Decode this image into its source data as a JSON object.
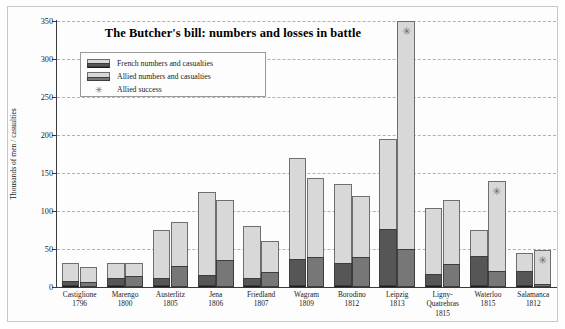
{
  "chart_data": {
    "type": "bar",
    "title": "The Butcher's bill:  numbers and losses in battle",
    "xlabel": "",
    "ylabel": "Thousands of men / casualties",
    "ylim": [
      0,
      350
    ],
    "yticks": [
      0,
      50,
      100,
      150,
      200,
      250,
      300,
      350
    ],
    "grid": true,
    "legend_position": "upper-left-inside",
    "categories": [
      "Castiglione 1796",
      "Marengo 1800",
      "Austerlitz 1805",
      "Jena 1806",
      "Friedland 1807",
      "Wagram 1809",
      "Borodino 1812",
      "Leipzig 1813",
      "Ligny-Quatrebras 1815",
      "Waterloo 1815",
      "Salamanca 1812"
    ],
    "battles": [
      {
        "name": "Castiglione",
        "year": "1796",
        "french_numbers": 31,
        "french_casualties": 6,
        "allied_numbers": 26,
        "allied_casualties": 6,
        "allied_success": false
      },
      {
        "name": "Marengo",
        "year": "1800",
        "french_numbers": 31,
        "french_casualties": 10,
        "allied_numbers": 31,
        "allied_casualties": 15,
        "allied_success": false
      },
      {
        "name": "Austerlitz",
        "year": "1805",
        "french_numbers": 75,
        "french_casualties": 10,
        "allied_numbers": 85,
        "allied_casualties": 27,
        "allied_success": false
      },
      {
        "name": "Jena",
        "year": "1806",
        "french_numbers": 125,
        "french_casualties": 15,
        "allied_numbers": 114,
        "allied_casualties": 35,
        "allied_success": false
      },
      {
        "name": "Friedland",
        "year": "1807",
        "french_numbers": 80,
        "french_casualties": 10,
        "allied_numbers": 60,
        "allied_casualties": 20,
        "allied_success": false
      },
      {
        "name": "Wagram",
        "year": "1809",
        "french_numbers": 170,
        "french_casualties": 35,
        "allied_numbers": 144,
        "allied_casualties": 40,
        "allied_success": false
      },
      {
        "name": "Borodino",
        "year": "1812",
        "french_numbers": 135,
        "french_casualties": 30,
        "allied_numbers": 120,
        "allied_casualties": 40,
        "allied_success": false
      },
      {
        "name": "Leipzig",
        "year": "1813",
        "french_numbers": 195,
        "french_casualties": 75,
        "allied_numbers": 350,
        "allied_casualties": 50,
        "allied_success": true
      },
      {
        "name": "Ligny-Quatrebras",
        "year": "1815",
        "french_numbers": 104,
        "french_casualties": 16,
        "allied_numbers": 115,
        "allied_casualties": 30,
        "allied_success": false
      },
      {
        "name": "Waterloo",
        "year": "1815",
        "french_numbers": 75,
        "french_casualties": 40,
        "allied_numbers": 140,
        "allied_casualties": 21,
        "allied_success": true
      },
      {
        "name": "Salamanca",
        "year": "1812",
        "french_numbers": 45,
        "french_casualties": 20,
        "allied_numbers": 49,
        "allied_casualties": 4,
        "allied_success": true
      }
    ],
    "series": [
      {
        "name": "French numbers",
        "values": [
          31,
          31,
          75,
          125,
          80,
          170,
          135,
          195,
          104,
          75,
          45
        ]
      },
      {
        "name": "French casualties",
        "values": [
          6,
          10,
          10,
          15,
          10,
          35,
          30,
          75,
          16,
          40,
          20
        ]
      },
      {
        "name": "Allied numbers",
        "values": [
          26,
          31,
          85,
          114,
          60,
          144,
          120,
          350,
          115,
          140,
          49
        ]
      },
      {
        "name": "Allied casualties",
        "values": [
          6,
          15,
          27,
          35,
          20,
          40,
          40,
          50,
          30,
          21,
          4
        ]
      }
    ]
  },
  "legend": {
    "items": [
      {
        "label": "French numbers and casualties",
        "marker": "french-swatch"
      },
      {
        "label": "Allied numbers and casualties",
        "marker": "allied-swatch"
      },
      {
        "label": "Allied success",
        "marker": "star-marker"
      }
    ]
  },
  "glyphs": {
    "star": "✳"
  },
  "colors": {
    "french_numbers": "#d8d8d8",
    "french_casualties": "#565656",
    "allied_numbers": "#d8d8d8",
    "allied_casualties": "#777777",
    "gridline": "#9aa7b8",
    "axis": "#3a3a3a",
    "star": "#6d6d6d"
  }
}
